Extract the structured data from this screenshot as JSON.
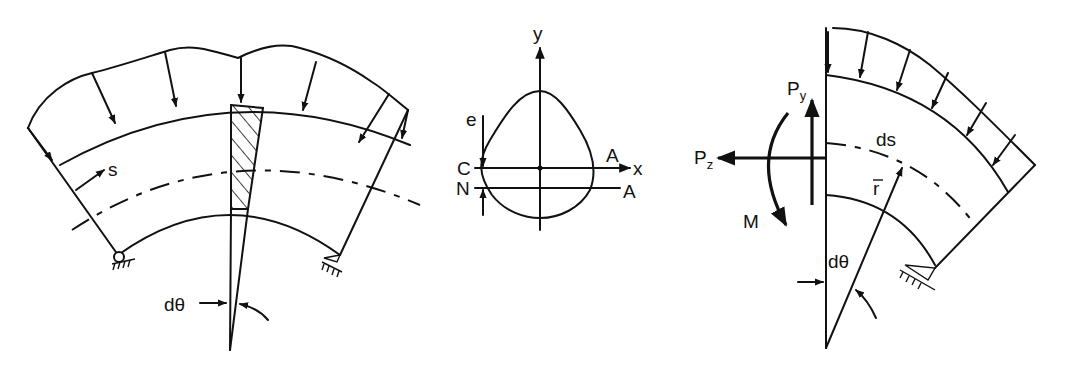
{
  "figure": {
    "panels": [
      {
        "id": "curved-beam-loaded",
        "description": "Curved beam between two pin supports with distributed radial load",
        "labels": {
          "s": "s",
          "d_theta": "dθ"
        }
      },
      {
        "id": "cross-section",
        "description": "Pear-shaped cross section with centroidal and neutral axes",
        "labels": {
          "y": "y",
          "x": "x",
          "e": "e",
          "C": "C",
          "N": "N",
          "A_top": "A",
          "A_bottom": "A"
        }
      },
      {
        "id": "free-body",
        "description": "Free body of curved beam segment with internal forces",
        "labels": {
          "P": "P",
          "y_sub": "y",
          "z_sub": "z",
          "M": "M",
          "ds": "ds",
          "r_bar": "r",
          "d_theta": "dθ"
        }
      }
    ],
    "colors": {
      "ink": "#111111",
      "background": "#ffffff"
    }
  }
}
